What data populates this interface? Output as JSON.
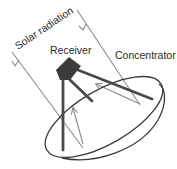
{
  "diagram": {
    "labels": {
      "solar_radiation": "Solar radiation",
      "receiver": "Receiver",
      "concentrator": "Concentrator"
    },
    "colors": {
      "background": "#ffffff",
      "text": "#2a2a2a",
      "dish_outline": "#3a3a3a",
      "receiver": "#3c3c3c",
      "support_arms": "#4a4a4a",
      "rays": "#8a8a8a"
    }
  }
}
